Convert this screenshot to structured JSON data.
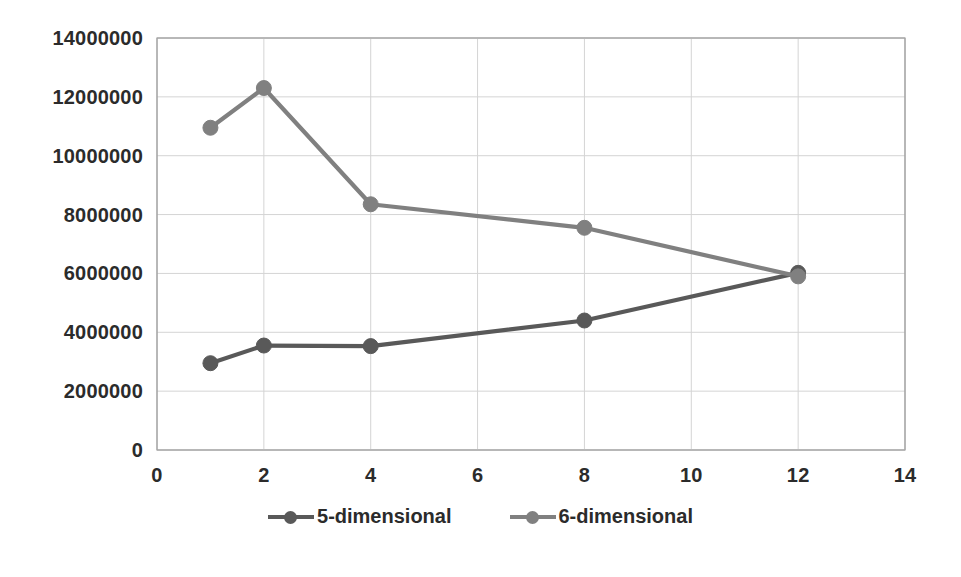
{
  "chart_data": {
    "type": "line",
    "title": "",
    "xlabel": "",
    "ylabel": "",
    "xlim": [
      0,
      14
    ],
    "ylim": [
      0,
      14000000
    ],
    "grid": true,
    "legend_position": "bottom",
    "x": [
      1,
      2,
      4,
      8,
      12
    ],
    "x_ticks": [
      "0",
      "2",
      "4",
      "6",
      "8",
      "10",
      "12",
      "14"
    ],
    "x_tick_values": [
      0,
      2,
      4,
      6,
      8,
      10,
      12,
      14
    ],
    "y_ticks": [
      "0",
      "2000000",
      "4000000",
      "6000000",
      "8000000",
      "10000000",
      "12000000",
      "14000000"
    ],
    "y_tick_values": [
      0,
      2000000,
      4000000,
      6000000,
      8000000,
      10000000,
      12000000,
      14000000
    ],
    "series": [
      {
        "name": "5-dimensional",
        "color": "#595959",
        "marker": "circle",
        "values": [
          2950000,
          3550000,
          3530000,
          4400000,
          6020000
        ]
      },
      {
        "name": "6-dimensional",
        "color": "#808080",
        "marker": "circle",
        "values": [
          10950000,
          12300000,
          8350000,
          7550000,
          5900000
        ]
      }
    ]
  },
  "legend": {
    "items": [
      {
        "label": "5-dimensional",
        "color": "#595959"
      },
      {
        "label": "6-dimensional",
        "color": "#808080"
      }
    ]
  },
  "axes": {
    "gridline_color": "#d4d4d4",
    "axis_color": "#a6a6a6"
  }
}
